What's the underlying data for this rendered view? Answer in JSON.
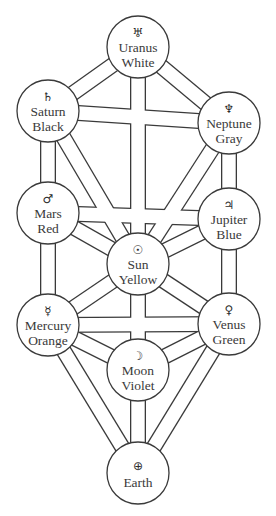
{
  "diagram": {
    "node_radius": 31,
    "colors": {
      "line": "#3a3a3a",
      "background": "#ffffff",
      "text": "#3a3a3a"
    },
    "nodes": [
      {
        "id": "uranus",
        "name": "Uranus",
        "color_label": "White",
        "symbol": "♅",
        "symbol_icon": "uranus-icon",
        "x": 138,
        "y": 47
      },
      {
        "id": "saturn",
        "name": "Saturn",
        "color_label": "Black",
        "symbol": "♄",
        "symbol_icon": "saturn-icon",
        "x": 48,
        "y": 111
      },
      {
        "id": "neptune",
        "name": "Neptune",
        "color_label": "Gray",
        "symbol": "♆",
        "symbol_icon": "neptune-icon",
        "x": 229,
        "y": 123
      },
      {
        "id": "mars",
        "name": "Mars",
        "color_label": "Red",
        "symbol": "♂",
        "symbol_icon": "mars-icon",
        "x": 48,
        "y": 213
      },
      {
        "id": "jupiter",
        "name": "Jupiter",
        "color_label": "Blue",
        "symbol": "♃",
        "symbol_icon": "jupiter-icon",
        "x": 229,
        "y": 219
      },
      {
        "id": "sun",
        "name": "Sun",
        "color_label": "Yellow",
        "symbol": "☉",
        "symbol_icon": "sun-icon",
        "x": 138,
        "y": 264
      },
      {
        "id": "mercury",
        "name": "Mercury",
        "color_label": "Orange",
        "symbol": "☿",
        "symbol_icon": "mercury-icon",
        "x": 48,
        "y": 325
      },
      {
        "id": "venus",
        "name": "Venus",
        "color_label": "Green",
        "symbol": "♀",
        "symbol_icon": "venus-icon",
        "x": 229,
        "y": 324
      },
      {
        "id": "moon",
        "name": "Moon",
        "color_label": "Violet",
        "symbol": "☽",
        "symbol_icon": "moon-icon",
        "x": 138,
        "y": 370
      },
      {
        "id": "earth",
        "name": "Earth",
        "color_label": "",
        "symbol": "⊕",
        "symbol_icon": "earth-icon",
        "x": 138,
        "y": 473
      }
    ],
    "paths": [
      [
        "uranus",
        "saturn"
      ],
      [
        "uranus",
        "neptune"
      ],
      [
        "uranus",
        "sun"
      ],
      [
        "saturn",
        "neptune"
      ],
      [
        "saturn",
        "mars"
      ],
      [
        "saturn",
        "sun"
      ],
      [
        "neptune",
        "jupiter"
      ],
      [
        "neptune",
        "sun"
      ],
      [
        "mars",
        "jupiter"
      ],
      [
        "mars",
        "sun"
      ],
      [
        "mars",
        "mercury"
      ],
      [
        "jupiter",
        "sun"
      ],
      [
        "jupiter",
        "venus"
      ],
      [
        "sun",
        "mercury"
      ],
      [
        "sun",
        "venus"
      ],
      [
        "sun",
        "moon"
      ],
      [
        "mercury",
        "venus"
      ],
      [
        "mercury",
        "moon"
      ],
      [
        "mercury",
        "earth"
      ],
      [
        "venus",
        "moon"
      ],
      [
        "venus",
        "earth"
      ],
      [
        "moon",
        "earth"
      ]
    ]
  }
}
